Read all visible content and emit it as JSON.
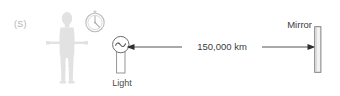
{
  "diagram": {
    "background_color": "#ffffff"
  },
  "observer": {
    "label": "(S)",
    "label_color": "#b3b3b3",
    "figure_color": "#e2e2e2",
    "figure_name": "person-silhouette"
  },
  "clock": {
    "name": "clock-icon",
    "outline_color": "#bdbdbd",
    "hand_color": "#bdbdbd"
  },
  "light_source": {
    "caption": "Light",
    "symbol": "sine-wave",
    "outline_color": "#6e6e6e",
    "caption_color": "#4d4d4d"
  },
  "distance": {
    "value": "150,000 km",
    "line_color": "#4a4a4a",
    "arrow_style": "double-headed",
    "text_color": "#3b3b3b"
  },
  "mirror": {
    "caption": "Mirror",
    "fill_color": "#f2f2f2",
    "outline_color": "#7a7a7a",
    "caption_color": "#3b3b3b"
  }
}
